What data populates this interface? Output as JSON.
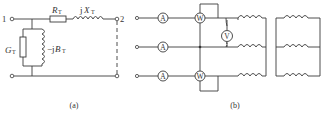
{
  "figure": {
    "panel_a": {
      "caption": "(a)",
      "terminal_left": "1",
      "terminal_right": "2",
      "series_resistor": {
        "symbol": "R",
        "subscript": "T"
      },
      "series_reactance": {
        "prefix": "j",
        "symbol": "X",
        "subscript": "T"
      },
      "shunt_conductance": {
        "symbol": "G",
        "subscript": "T"
      },
      "shunt_susceptance": {
        "prefix": "−j",
        "symbol": "B",
        "subscript": "T"
      }
    },
    "panel_b": {
      "caption": "(b)",
      "ammeter_label": "A",
      "wattmeter_label": "W",
      "voltmeter_label": "V"
    }
  }
}
